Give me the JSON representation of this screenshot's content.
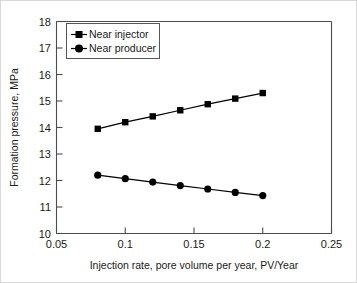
{
  "chart_data": {
    "type": "line",
    "title": "",
    "xlabel": "Injection rate, pore volume per year, PV/Year",
    "ylabel": "Formation pressure, MPa",
    "xlim": [
      0.05,
      0.25
    ],
    "ylim": [
      10,
      18
    ],
    "xticks": [
      "0.05",
      "0.1",
      "0.15",
      "0.2",
      "0.25"
    ],
    "xtick_values": [
      0.05,
      0.1,
      0.15,
      0.2,
      0.25
    ],
    "yticks": [
      "10",
      "11",
      "12",
      "13",
      "14",
      "15",
      "16",
      "17",
      "18"
    ],
    "ytick_values": [
      10,
      11,
      12,
      13,
      14,
      15,
      16,
      17,
      18
    ],
    "grid": false,
    "legend_position": "upper-left-inside",
    "x": [
      0.08,
      0.1,
      0.12,
      0.14,
      0.16,
      0.18,
      0.2
    ],
    "series": [
      {
        "name": "Near injector",
        "marker": "square",
        "color": "#000000",
        "values": [
          13.95,
          14.2,
          14.42,
          14.65,
          14.88,
          15.09,
          15.3
        ]
      },
      {
        "name": "Near producer",
        "marker": "circle",
        "color": "#000000",
        "values": [
          12.2,
          12.07,
          11.94,
          11.81,
          11.68,
          11.55,
          11.43
        ]
      }
    ]
  },
  "legend": {
    "entries": [
      {
        "label": "Near injector"
      },
      {
        "label": "Near producer"
      }
    ]
  },
  "colors": {
    "ink": "#000000",
    "axis": "#4d4d4d",
    "frame": "#d9d9d9"
  }
}
